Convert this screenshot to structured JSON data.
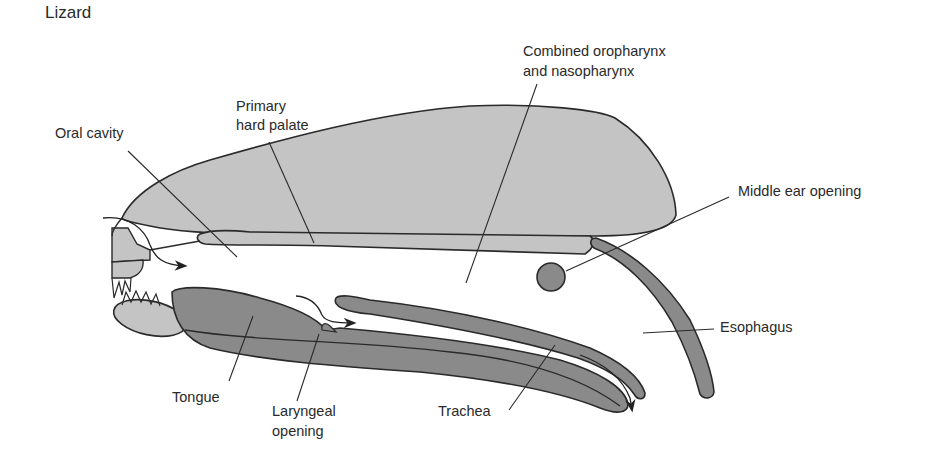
{
  "diagram": {
    "title": "Lizard",
    "labels": {
      "oral_cavity": "Oral cavity",
      "primary_hard_palate_line1": "Primary",
      "primary_hard_palate_line2": "hard palate",
      "combined_pharynx_line1": "Combined oropharynx",
      "combined_pharynx_line2": "and nasopharynx",
      "middle_ear_opening": "Middle ear opening",
      "esophagus": "Esophagus",
      "tongue": "Tongue",
      "laryngeal_opening_line1": "Laryngeal",
      "laryngeal_opening_line2": "opening",
      "trachea": "Trachea"
    },
    "colors": {
      "light_fill": "#c4c4c4",
      "dark_fill": "#8a8a8a",
      "outline": "#2a2a2a",
      "background": "#ffffff"
    }
  }
}
